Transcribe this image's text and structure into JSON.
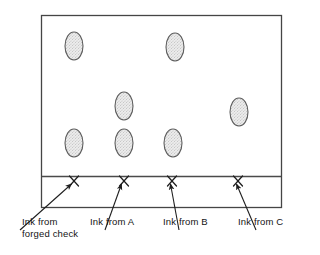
{
  "figure": {
    "kind": "chromatography-plate-diagram",
    "plate": {
      "x": 41,
      "y": 15,
      "width": 241,
      "height": 193,
      "baseline_y": 176,
      "border_color": "#3c3c3c",
      "fill_color": "#ffffff"
    },
    "origin_marks": [
      {
        "name": "origin-mark-forged-check",
        "glyph": "X",
        "x": 74,
        "y": 176
      },
      {
        "name": "origin-mark-a",
        "glyph": "X",
        "x": 124,
        "y": 176
      },
      {
        "name": "origin-mark-b",
        "glyph": "X",
        "x": 172,
        "y": 176
      },
      {
        "name": "origin-mark-c",
        "glyph": "X",
        "x": 238,
        "y": 176
      }
    ],
    "spots": [
      {
        "name": "ink-spot-1",
        "lane": "forged check",
        "cx": 74,
        "cy": 46,
        "rx": 9,
        "ry": 14
      },
      {
        "name": "ink-spot-2",
        "lane": "A",
        "cx": 175,
        "cy": 47,
        "rx": 9,
        "ry": 14
      },
      {
        "name": "ink-spot-3",
        "lane": "A",
        "cx": 124,
        "cy": 106,
        "rx": 9,
        "ry": 14
      },
      {
        "name": "ink-spot-4",
        "lane": "C",
        "cx": 239,
        "cy": 112,
        "rx": 9,
        "ry": 14
      },
      {
        "name": "ink-spot-5",
        "lane": "forged check",
        "cx": 74,
        "cy": 143,
        "rx": 9,
        "ry": 14
      },
      {
        "name": "ink-spot-6",
        "lane": "A",
        "cx": 124,
        "cy": 143,
        "rx": 9,
        "ry": 14
      },
      {
        "name": "ink-spot-7",
        "lane": "B",
        "cx": 173,
        "cy": 143,
        "rx": 9,
        "ry": 14
      },
      {
        "name": "ink-spot-8",
        "lane": "C",
        "cx": 239,
        "cy": 112,
        "rx": 9,
        "ry": 14
      }
    ],
    "spot_style": {
      "outline_color": "#5a5a5a",
      "fill_color": "#e8e8e8",
      "stipple_color": "#8a8a8a"
    },
    "leaders": [
      {
        "name": "leader-forged-check",
        "tail_x": 20,
        "tail_y": 228,
        "head_x": 72,
        "head_y": 182
      },
      {
        "name": "leader-a",
        "tail_x": 108,
        "tail_y": 228,
        "head_x": 122,
        "head_y": 182
      },
      {
        "name": "leader-b",
        "tail_x": 177,
        "tail_y": 228,
        "head_x": 170,
        "head_y": 182
      },
      {
        "name": "leader-c",
        "tail_x": 254,
        "tail_y": 228,
        "head_x": 236,
        "head_y": 182
      }
    ]
  },
  "labels": {
    "forged_check_line1": "Ink from",
    "forged_check_line2": "forged check",
    "ink_from_a": "Ink from A",
    "ink_from_b": "Ink from B",
    "ink_from_c": "Ink from C"
  }
}
